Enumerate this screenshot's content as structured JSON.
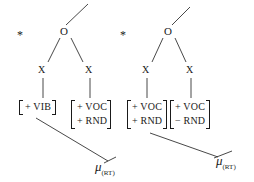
{
  "diagram": {
    "left": {
      "star": "*",
      "onset": "O",
      "x1": "X",
      "x2": "X",
      "seg1": [
        "+ VIB"
      ],
      "seg2": [
        "+ VOC",
        "+ RND"
      ],
      "mu": "μ",
      "mu_sub": "(RT)"
    },
    "right": {
      "star": "*",
      "onset": "O",
      "x1": "X",
      "x2": "X",
      "seg1": [
        "+ VOC",
        "+ RND"
      ],
      "seg2": [
        "+ VOC",
        "− RND"
      ],
      "mu": "μ",
      "mu_sub": "(RT)"
    }
  }
}
